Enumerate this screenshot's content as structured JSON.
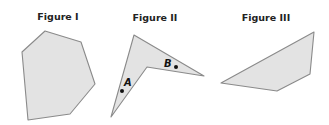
{
  "figures": [
    {
      "title": "Figure I",
      "title_pos": [
        58,
        20
      ],
      "points": "45,31 81,42 95,84 70,114 28,120 22,52",
      "labels": []
    },
    {
      "title": "Figure II",
      "title_pos": [
        155,
        21
      ],
      "points": "134,35 204,76 147,67 111,117",
      "labels": [
        {
          "text": "A",
          "x": 124,
          "y": 86,
          "dot_x": 122,
          "dot_y": 91
        },
        {
          "text": "B",
          "x": 165,
          "y": 67,
          "dot_x": 176,
          "dot_y": 67
        }
      ]
    },
    {
      "title": "Figure III",
      "title_pos": [
        266,
        21
      ],
      "points": "314,32 310,74 277,91 221,83",
      "labels": []
    }
  ],
  "colors": {
    "fill": "#e3e3e3",
    "stroke": "#8a8a8a",
    "text": "#222222"
  }
}
